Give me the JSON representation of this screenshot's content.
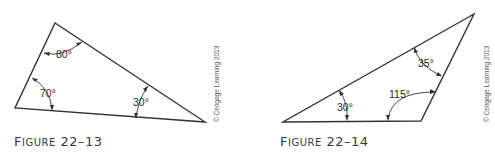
{
  "figures": [
    {
      "caption_prefix": "F",
      "caption_rest": "IGURE",
      "caption_number": "22–13",
      "copyright": "© Cengage Learning 2013",
      "angles": [
        {
          "vertex": "top",
          "label": "80°"
        },
        {
          "vertex": "bottom-left",
          "label": "70°"
        },
        {
          "vertex": "bottom-right",
          "label": "30°"
        }
      ]
    },
    {
      "caption_prefix": "F",
      "caption_rest": "IGURE",
      "caption_number": "22–14",
      "copyright": "© Cengage Learning 2013",
      "angles": [
        {
          "vertex": "top-right",
          "label": "35°"
        },
        {
          "vertex": "bottom-left",
          "label": "30°"
        },
        {
          "vertex": "bottom-right",
          "label": "115°"
        }
      ]
    }
  ]
}
